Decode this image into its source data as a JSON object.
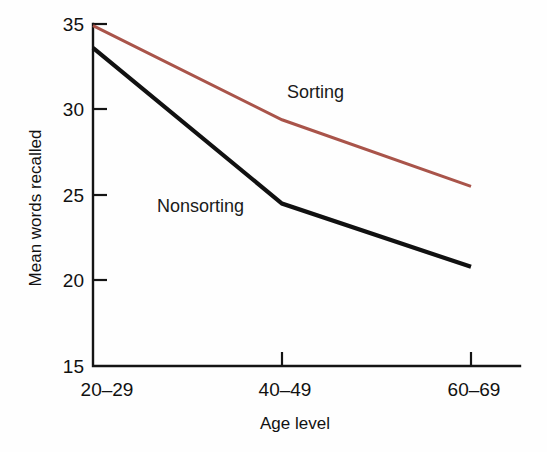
{
  "chart_data": {
    "type": "line",
    "title": "",
    "xlabel": "Age level",
    "ylabel": "Mean words recalled",
    "categories": [
      "20–29",
      "40–49",
      "60–69"
    ],
    "ylim": [
      15,
      35
    ],
    "yticks": [
      15,
      20,
      25,
      30,
      35
    ],
    "ytick_labels": [
      "15",
      "20",
      "25",
      "30",
      "35"
    ],
    "grid": false,
    "legend_position": "inline-annotations",
    "series": [
      {
        "name": "Sorting",
        "label": "Sorting",
        "color": "#a9544a",
        "values": [
          34.9,
          29.4,
          25.5
        ]
      },
      {
        "name": "Nonsorting",
        "label": "Nonsorting",
        "color": "#111111",
        "values": [
          33.6,
          24.5,
          20.8
        ]
      }
    ],
    "annotations": [
      {
        "text": "Sorting",
        "x_px": 287,
        "y_px": 98
      },
      {
        "text": "Nonsorting",
        "x_px": 157,
        "y_px": 212
      }
    ]
  },
  "axis": {
    "y_tick_0": "15",
    "y_tick_1": "20",
    "y_tick_2": "25",
    "y_tick_3": "30",
    "y_tick_4": "35",
    "x_tick_0": "20–29",
    "x_tick_1": "40–49",
    "x_tick_2": "60–69",
    "x_title": "Age level",
    "y_title": "Mean words recalled"
  },
  "labels": {
    "sorting": "Sorting",
    "nonsorting": "Nonsorting"
  },
  "colors": {
    "sorting_line": "#a9544a",
    "nonsorting_line": "#111111",
    "axis": "#141414",
    "background": "#fefefe"
  }
}
